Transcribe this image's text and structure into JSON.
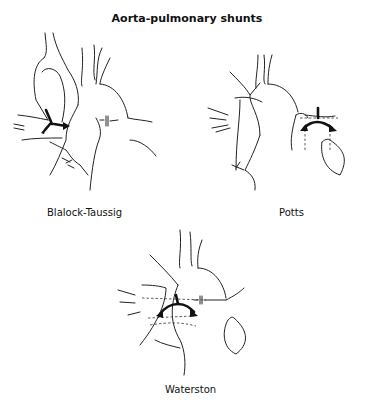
{
  "figure": {
    "title": "Aorta-pulmonary shunts",
    "panels": [
      {
        "id": "blalock-taussig",
        "label": "Blalock-Taussig"
      },
      {
        "id": "potts",
        "label": "Potts"
      },
      {
        "id": "waterston",
        "label": "Waterston"
      }
    ]
  }
}
